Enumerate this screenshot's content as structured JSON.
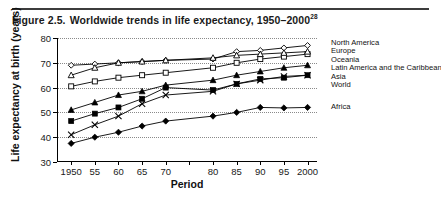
{
  "caption": {
    "figure_number": "Figure 2.5.",
    "title": "Worldwide trends in life expectancy, 1950–2000",
    "footnote_marker": "28"
  },
  "chart_data": {
    "type": "line",
    "title": "Worldwide trends in life expectancy, 1950–2000",
    "xlabel": "Period",
    "ylabel": "Life expectancy at birth (years)",
    "x": [
      1950,
      1955,
      1960,
      1965,
      1970,
      1980,
      1985,
      1990,
      1995,
      2000
    ],
    "xtick_labels": [
      "1950",
      "55",
      "60",
      "65",
      "70",
      "",
      "80",
      "85",
      "90",
      "95",
      "2000"
    ],
    "xtick_values": [
      1950,
      1955,
      1960,
      1965,
      1970,
      1975,
      1980,
      1985,
      1990,
      1995,
      2000
    ],
    "ytick_labels": [
      "30",
      "40",
      "50",
      "60",
      "70",
      "80"
    ],
    "ytick_values": [
      30,
      40,
      50,
      60,
      70,
      80
    ],
    "xlim": [
      1947,
      2002
    ],
    "ylim": [
      30,
      80
    ],
    "grid": "horizontal-dotted",
    "legend_position": "right",
    "series": [
      {
        "name": "North America",
        "marker": "open-diamond",
        "values": [
          69.0,
          69.5,
          70.0,
          70.5,
          71.0,
          71.5,
          74.5,
          75.0,
          76.0,
          77.0
        ]
      },
      {
        "name": "Europe",
        "marker": "open-square",
        "values": [
          60.5,
          62.5,
          64.0,
          65.0,
          66.0,
          68.0,
          70.0,
          71.5,
          72.5,
          73.5
        ]
      },
      {
        "name": "Oceania",
        "marker": "open-triangle",
        "values": [
          65.0,
          68.0,
          70.0,
          70.5,
          71.0,
          72.0,
          73.0,
          73.5,
          74.0,
          74.5
        ]
      },
      {
        "name": "Latin America and the Caribbean",
        "marker": "filled-triangle",
        "values": [
          51.0,
          54.0,
          57.0,
          58.5,
          61.0,
          63.0,
          65.0,
          66.5,
          68.0,
          69.0
        ]
      },
      {
        "name": "Asia",
        "marker": "filled-square",
        "values": [
          46.5,
          49.5,
          52.0,
          55.5,
          60.0,
          59.0,
          61.5,
          63.5,
          64.0,
          65.0
        ]
      },
      {
        "name": "World",
        "marker": "cross",
        "values": [
          41.0,
          45.0,
          48.5,
          53.5,
          57.0,
          58.5,
          61.5,
          63.0,
          64.5,
          65.0
        ]
      },
      {
        "name": "Africa",
        "marker": "filled-diamond",
        "values": [
          37.5,
          40.0,
          42.0,
          44.5,
          46.5,
          48.5,
          50.0,
          52.0,
          51.8,
          52.0
        ]
      }
    ],
    "inline_labels": [
      {
        "text": "Africa",
        "series": "Africa"
      }
    ]
  }
}
